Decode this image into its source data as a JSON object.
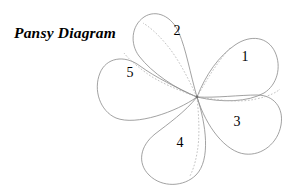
{
  "page": {
    "background_color": "#ffffff",
    "width": 299,
    "height": 195
  },
  "title": {
    "text": "Pansy Diagram"
  },
  "diagram": {
    "name": "pansy-flower-petal-diagram",
    "center": {
      "x": 197,
      "y": 97
    },
    "outline_color": "#8a8a8a",
    "hidden_edge_color": "#b4b4b4",
    "label_color": "#000000",
    "petal_count": 5,
    "petals": [
      {
        "label": "1",
        "label_x": 245,
        "label_y": 58,
        "position": "upper-right",
        "outline": "M 197 97 C 206 74 219 56 235 45 C 251 34 268 37 275 52 C 282 67 277 85 264 93 C 248 102 222 103 197 97 Z",
        "hidden_edge": "M 197 97 C 207 79 218 61 231 47"
      },
      {
        "label": "2",
        "label_x": 177,
        "label_y": 32,
        "position": "top",
        "outline": "M 197 97 C 190 73 186 49 179 33 C 172 16 156 9 144 17 C 131 26 130 44 139 56 C 152 73 176 89 197 97 Z",
        "hidden_edge": "M 197 97 C 188 78 178 58 166 44 C 156 32 148 26 143 23"
      },
      {
        "label": "3",
        "label_x": 237,
        "label_y": 123,
        "position": "lower-right",
        "outline": "M 197 97 C 216 98 240 95 257 95 C 274 95 284 108 281 125 C 278 143 262 156 245 154 C 226 152 206 127 197 97 Z",
        "hidden_edge": "M 197 97 C 218 100 240 103 256 99 C 270 96 277 92 280 89"
      },
      {
        "label": "4",
        "label_x": 180,
        "label_y": 144,
        "position": "bottom",
        "outline": "M 197 97 C 185 112 168 124 155 134 C 140 146 137 163 149 175 C 162 188 184 187 196 175 C 211 160 206 124 197 97 Z",
        "hidden_edge": "M 197 97 C 199 117 200 138 197 153 C 195 165 192 172 190 176"
      },
      {
        "label": "5",
        "label_x": 130,
        "label_y": 74,
        "position": "left",
        "outline": "M 197 97 C 177 88 155 77 140 66 C 124 54 106 58 100 73 C 93 90 100 111 116 118 C 136 126 176 112 197 97 Z",
        "hidden_edge": "M 197 97 C 178 90 158 82 145 72 C 133 63 127 57 124 53"
      }
    ]
  }
}
